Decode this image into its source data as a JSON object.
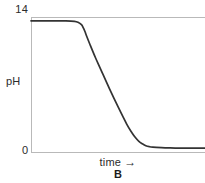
{
  "figure": {
    "caption": "B",
    "background_color": "#ffffff",
    "axis_color": "#b9b9b9",
    "curve_color": "#333333"
  },
  "axes": {
    "y_label": "pH",
    "y_tick_top": "14",
    "y_tick_bottom": "0",
    "x_label": "time",
    "x_arrow": "→"
  },
  "chart_data": {
    "type": "line",
    "title": "",
    "subtitle": "",
    "xlabel": "time",
    "ylabel": "pH",
    "annotations": [
      "B"
    ],
    "legend": [],
    "legend_position": "none",
    "grid": false,
    "xlim": [
      0,
      100
    ],
    "ylim": [
      0,
      14
    ],
    "x_tick_labels": [],
    "y_tick_labels": [
      "0",
      "14"
    ],
    "series": [
      {
        "name": "pH vs time",
        "color": "#333333",
        "x": [
          0,
          5,
          10,
          15,
          20,
          25,
          27,
          29,
          30,
          31,
          32,
          34,
          37,
          40,
          45,
          50,
          55,
          58,
          60,
          62,
          64,
          66,
          68,
          70,
          75,
          80,
          85,
          90,
          95,
          100
        ],
        "y": [
          13.6,
          13.6,
          13.6,
          13.6,
          13.6,
          13.55,
          13.45,
          13.2,
          12.9,
          12.5,
          12.0,
          11.1,
          9.8,
          8.6,
          6.6,
          4.7,
          2.9,
          2.0,
          1.5,
          1.1,
          0.85,
          0.65,
          0.55,
          0.5,
          0.45,
          0.42,
          0.4,
          0.4,
          0.4,
          0.4
        ]
      }
    ]
  }
}
